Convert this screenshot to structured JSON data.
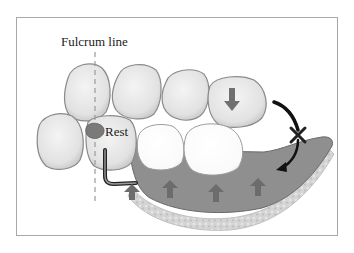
{
  "diagram": {
    "labels": {
      "fulcrum_line": "Fulcrum line",
      "rest": "Rest"
    },
    "colors": {
      "tooth_fill": "#e6e6e6",
      "tooth_stroke": "#8a8a8a",
      "denture_base": "#8c8c8c",
      "mucosa": "#d2d2d2",
      "arrow_gray": "#6e6e6e",
      "rotation_arrow": "#111111",
      "frame": "#a8a8a8"
    },
    "elements": [
      "fulcrum-line",
      "natural-teeth",
      "rest",
      "clasp",
      "denture-base",
      "artificial-teeth",
      "occlusal-force-arrow",
      "tissue-support-arrows",
      "rotation-arrows",
      "rotation-x-mark"
    ]
  }
}
